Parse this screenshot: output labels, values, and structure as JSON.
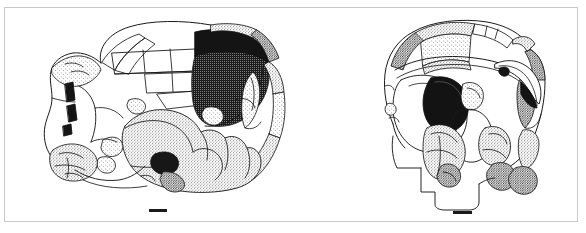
{
  "figure": {
    "kind": "scientific-line-drawing",
    "caption": "",
    "panel_count": 2,
    "background_color": "#ffffff",
    "ink_color": "#1a1a1a",
    "frame_color": "#c9c9c9"
  },
  "panels": [
    {
      "id": "lateral",
      "label": "",
      "view": "lateral view of reconstructed cranium",
      "scale_bar": {
        "label": "",
        "visible": true
      }
    },
    {
      "id": "frontal",
      "label": "",
      "view": "frontal view of reconstructed cranium",
      "scale_bar": {
        "label": "",
        "visible": true
      }
    }
  ]
}
